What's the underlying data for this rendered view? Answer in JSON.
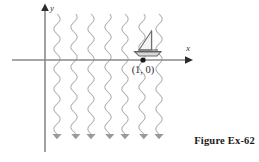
{
  "figure": {
    "caption": "Figure Ex-62",
    "axes": {
      "x_label": "x",
      "y_label": "y",
      "x_axis_y_px": 60,
      "y_axis_x_px": 45,
      "axis_color": "#8a8a8a",
      "arrowhead_color": "#2b2b2b"
    },
    "point": {
      "label": "(1, 0)",
      "x_px": 143,
      "y_px": 60,
      "dot_color": "#1a1a1a",
      "dot_radius": 2.6
    },
    "boat": {
      "name": "sailboat",
      "mast_top_y_px": 31,
      "hull_y_px": 52,
      "color": "#6e6e6e",
      "sail_fill": "#f2f2f2"
    },
    "current": {
      "description": "downward flowing wavy current lines",
      "count": 7,
      "line_color": "#b0b0b0",
      "arrow_color": "#9a9a9a",
      "top_y_px": 14,
      "bottom_y_px": 134,
      "x_positions": [
        57,
        74,
        91,
        108,
        125,
        142,
        159
      ],
      "wave_amplitude_px": 3.2,
      "wave_period_px": 20
    }
  }
}
